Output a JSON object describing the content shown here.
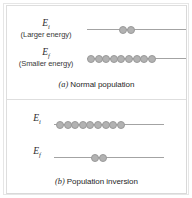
{
  "figure": {
    "colors": {
      "atom_fill": "#b2b2b2",
      "atom_stroke": "#9a9a9a",
      "level_line": "#a3a3a3",
      "frame": "#dedede",
      "text": "#262626"
    }
  },
  "panel_a": {
    "caption_id": "(a)",
    "caption_text": "Normal population",
    "upper": {
      "symbol": "E",
      "subscript": "i",
      "description": "(Larger energy)",
      "atom_count": 2
    },
    "lower": {
      "symbol": "E",
      "subscript": "f",
      "description": "(Smaller energy)",
      "atom_count": 9
    }
  },
  "panel_b": {
    "caption_id": "(b)",
    "caption_text": "Population inversion",
    "upper": {
      "symbol": "E",
      "subscript": "i",
      "description": "",
      "atom_count": 9
    },
    "lower": {
      "symbol": "E",
      "subscript": "f",
      "description": "",
      "atom_count": 2
    }
  },
  "chart_data": {
    "type": "bar",
    "xlabel": "Energy level",
    "ylabel": "Number of atoms",
    "categories": [
      "E_i (Larger energy)",
      "E_f (Smaller energy)"
    ],
    "series": [
      {
        "name": "(a) Normal population",
        "values": [
          2,
          9
        ]
      },
      {
        "name": "(b) Population inversion",
        "values": [
          9,
          2
        ]
      }
    ],
    "ylim": [
      0,
      10
    ],
    "grid": false,
    "legend": "none",
    "annotations": [
      "(a) Normal population",
      "(b) Population inversion"
    ]
  }
}
